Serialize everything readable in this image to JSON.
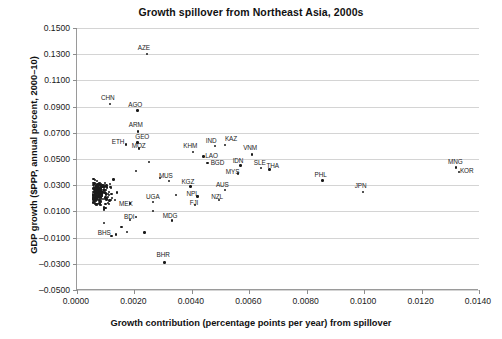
{
  "chart_data": {
    "type": "scatter",
    "title": "Growth spillover from Northeast Asia, 2000s",
    "xlabel": "Growth contribution (percentage points per year) from spillover",
    "ylabel": "GDP growth ($PPP, annual percent, 2000–10)",
    "xlim": [
      0.0,
      0.014
    ],
    "ylim": [
      -0.05,
      0.15
    ],
    "xticks": [
      "0.0000",
      "0.0020",
      "0.0040",
      "0.0060",
      "0.0080",
      "0.0100",
      "0.0120",
      "0.0140"
    ],
    "yticks": [
      "0.1500",
      "0.1300",
      "0.1100",
      "0.0900",
      "0.0700",
      "0.0500",
      "0.0300",
      "0.0100",
      "-0.0100",
      "-0.0300",
      "-0.0500"
    ],
    "grid": "horizontal",
    "legend": "none",
    "marker_color": "#1a1a1a",
    "grid_color": "#d4d4d4",
    "axis_color": "#9a9a9a",
    "labeled_points": [
      {
        "label": "AZE",
        "x": 0.00243,
        "y": 0.13,
        "lx": -9,
        "ly": -9
      },
      {
        "label": "CHN",
        "x": 0.00115,
        "y": 0.092,
        "lx": -9,
        "ly": -9
      },
      {
        "label": "AGO",
        "x": 0.0021,
        "y": 0.087,
        "lx": -9,
        "ly": -9
      },
      {
        "label": "ARM",
        "x": 0.00212,
        "y": 0.071,
        "lx": -9,
        "ly": -9
      },
      {
        "label": "GEO",
        "x": 0.0021,
        "y": 0.0625,
        "lx": -2,
        "ly": -9
      },
      {
        "label": "ETH",
        "x": 0.0017,
        "y": 0.061,
        "lx": -14,
        "ly": -6
      },
      {
        "label": "MOZ",
        "x": 0.00215,
        "y": 0.058,
        "lx": -7,
        "ly": -6
      },
      {
        "label": "IND",
        "x": 0.0048,
        "y": 0.06,
        "lx": -9,
        "ly": -8
      },
      {
        "label": "KAZ",
        "x": 0.00515,
        "y": 0.0605,
        "lx": 0,
        "ly": -9
      },
      {
        "label": "KHM",
        "x": 0.00405,
        "y": 0.0555,
        "lx": -10,
        "ly": -9
      },
      {
        "label": "LAO",
        "x": 0.0044,
        "y": 0.052,
        "lx": 2,
        "ly": -3
      },
      {
        "label": "BGD",
        "x": 0.00455,
        "y": 0.047,
        "lx": 3,
        "ly": -3
      },
      {
        "label": "VNM",
        "x": 0.0061,
        "y": 0.0535,
        "lx": -9,
        "ly": -9
      },
      {
        "label": "IDN",
        "x": 0.0057,
        "y": 0.045,
        "lx": -8,
        "ly": -8
      },
      {
        "label": "SLE",
        "x": 0.0064,
        "y": 0.043,
        "lx": -7,
        "ly": -8
      },
      {
        "label": "THA",
        "x": 0.0067,
        "y": 0.042,
        "lx": -3,
        "ly": -6
      },
      {
        "label": "MYS",
        "x": 0.0056,
        "y": 0.039,
        "lx": -12,
        "ly": -4
      },
      {
        "label": "PHL",
        "x": 0.00855,
        "y": 0.0335,
        "lx": -8,
        "ly": -9
      },
      {
        "label": "JPN",
        "x": 0.00995,
        "y": 0.025,
        "lx": -8,
        "ly": -9
      },
      {
        "label": "MNG",
        "x": 0.0132,
        "y": 0.0435,
        "lx": -8,
        "ly": -9
      },
      {
        "label": "KOR",
        "x": 0.0133,
        "y": 0.04,
        "lx": 1,
        "ly": -4
      },
      {
        "label": "MUS",
        "x": 0.0032,
        "y": 0.033,
        "lx": -10,
        "ly": -8
      },
      {
        "label": "KGZ",
        "x": 0.00395,
        "y": 0.029,
        "lx": -9,
        "ly": -8
      },
      {
        "label": "AUS",
        "x": 0.00515,
        "y": 0.0265,
        "lx": -9,
        "ly": -8
      },
      {
        "label": "NPL",
        "x": 0.0042,
        "y": 0.0215,
        "lx": -11,
        "ly": -5
      },
      {
        "label": "NZL",
        "x": 0.00495,
        "y": 0.0185,
        "lx": -8,
        "ly": -6
      },
      {
        "label": "FJI",
        "x": 0.0041,
        "y": 0.015,
        "lx": -5,
        "ly": -5
      },
      {
        "label": "UGA",
        "x": 0.00265,
        "y": 0.017,
        "lx": -7,
        "ly": -8
      },
      {
        "label": "MEX",
        "x": 0.00185,
        "y": 0.016,
        "lx": -11,
        "ly": -3
      },
      {
        "label": "MDG",
        "x": 0.0033,
        "y": 0.003,
        "lx": -9,
        "ly": -8
      },
      {
        "label": "BDI",
        "x": 0.00185,
        "y": 0.0035,
        "lx": -6,
        "ly": -6
      },
      {
        "label": "BHS",
        "x": 0.00135,
        "y": -0.0075,
        "lx": -18,
        "ly": -4
      },
      {
        "label": "BHR",
        "x": 0.00305,
        "y": -0.029,
        "lx": -8,
        "ly": -10
      }
    ],
    "unlabeled_cluster_note": "dense cluster of ~180 additional country points between x=0.0005 and x=0.0030, y=-0.010 to 0.065"
  }
}
